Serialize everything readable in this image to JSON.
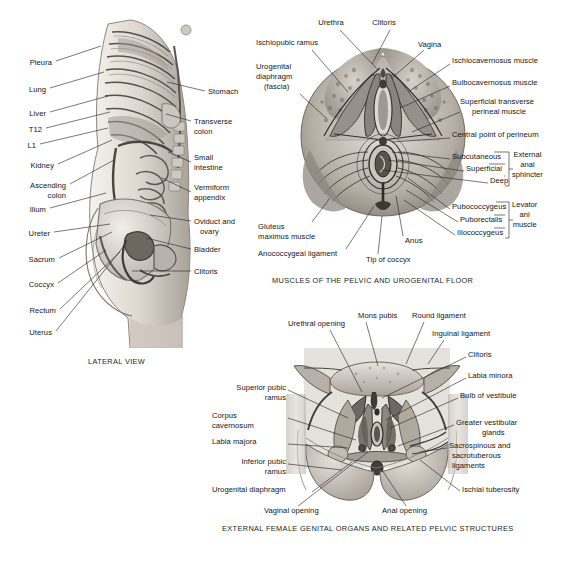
{
  "figure": {
    "background": "#ffffff",
    "ink": "#262626"
  },
  "panels": [
    {
      "id": "lateral",
      "caption": "LATERAL VIEW",
      "labels_left": [
        {
          "text": "Pleura",
          "x": 26,
          "y": 58,
          "lx": 56,
          "ly": 61,
          "tx": 101,
          "ty": 46
        },
        {
          "text": "Lung",
          "x": 26,
          "y": 85,
          "lx": 50,
          "ly": 88,
          "tx": 104,
          "ty": 72
        },
        {
          "text": "Liver",
          "x": 26,
          "y": 109,
          "lx": 50,
          "ly": 112,
          "tx": 108,
          "ty": 96
        },
        {
          "text": "T12",
          "x": 26,
          "y": 125,
          "lx": 46,
          "ly": 128,
          "tx": 110,
          "ty": 112
        },
        {
          "text": "L1",
          "x": 26,
          "y": 141,
          "lx": 40,
          "ly": 144,
          "tx": 108,
          "ty": 128
        },
        {
          "text": "Kidney",
          "x": 26,
          "y": 161,
          "lx": 58,
          "ly": 164,
          "tx": 112,
          "ty": 140
        },
        {
          "text": "Ascending",
          "x": 26,
          "y": 181,
          "lx": 70,
          "ly": 184,
          "tx": 114,
          "ty": 160
        },
        {
          "text": "colon",
          "x": 38,
          "y": 191,
          "lx": null,
          "ly": null,
          "tx": null,
          "ty": null
        },
        {
          "text": "Ilium",
          "x": 26,
          "y": 205,
          "lx": 50,
          "ly": 208,
          "tx": 106,
          "ty": 193
        },
        {
          "text": "Ureter",
          "x": 26,
          "y": 229,
          "lx": 54,
          "ly": 232,
          "tx": 108,
          "ty": 222
        },
        {
          "text": "Sacrum",
          "x": 26,
          "y": 255,
          "lx": 59,
          "ly": 258,
          "tx": 110,
          "ty": 232
        },
        {
          "text": "Coccyx",
          "x": 26,
          "y": 280,
          "lx": 58,
          "ly": 283,
          "tx": 104,
          "ty": 250
        },
        {
          "text": "Rectum",
          "x": 26,
          "y": 306,
          "lx": 60,
          "ly": 309,
          "tx": 118,
          "ty": 252
        },
        {
          "text": "Uterus",
          "x": 26,
          "y": 328,
          "lx": 56,
          "ly": 331,
          "tx": 122,
          "ty": 245
        }
      ],
      "labels_right": [
        {
          "text": "Stomach",
          "x": 208,
          "y": 88,
          "lx": 205,
          "ly": 91,
          "tx": 167,
          "ty": 82
        },
        {
          "text": "Transverse",
          "x": 194,
          "y": 118,
          "lx": 191,
          "ly": 121,
          "tx": 166,
          "ty": 113
        },
        {
          "text": "colon",
          "x": 194,
          "y": 128,
          "lx": null,
          "ly": null,
          "tx": null,
          "ty": null
        },
        {
          "text": "Small",
          "x": 194,
          "y": 154,
          "lx": 191,
          "ly": 162,
          "tx": 168,
          "ty": 152
        },
        {
          "text": "intestine",
          "x": 194,
          "y": 164,
          "lx": null,
          "ly": null,
          "tx": null,
          "ty": null
        },
        {
          "text": "Vermiform",
          "x": 194,
          "y": 184,
          "lx": 191,
          "ly": 192,
          "tx": 162,
          "ty": 178
        },
        {
          "text": "appendix",
          "x": 194,
          "y": 194,
          "lx": null,
          "ly": null,
          "tx": null,
          "ty": null
        },
        {
          "text": "Oviduct and",
          "x": 194,
          "y": 218,
          "lx": 191,
          "ly": 221,
          "tx": 150,
          "ty": 215
        },
        {
          "text": "ovary",
          "x": 200,
          "y": 228,
          "lx": null,
          "ly": null,
          "tx": null,
          "ty": null
        },
        {
          "text": "Bladder",
          "x": 194,
          "y": 246,
          "lx": 191,
          "ly": 249,
          "tx": 146,
          "ty": 238
        },
        {
          "text": "Clitoris",
          "x": 194,
          "y": 268,
          "lx": 191,
          "ly": 271,
          "tx": 132,
          "ty": 271
        }
      ]
    },
    {
      "id": "pelvic-floor",
      "caption": "MUSCLES OF THE PELVIC AND UROGENITAL FLOOR",
      "labels": [
        {
          "text": "Urethra",
          "x": 331,
          "y": 22,
          "align": "center"
        },
        {
          "text": "Clitoris",
          "x": 384,
          "y": 22,
          "align": "center"
        },
        {
          "text": "Vagina",
          "x": 418,
          "y": 44,
          "align": "left"
        },
        {
          "text": "Ischiopubic ramus",
          "x": 256,
          "y": 42,
          "align": "left"
        },
        {
          "text": "Urogenital",
          "x": 256,
          "y": 66,
          "align": "left"
        },
        {
          "text": "diaphragm",
          "x": 256,
          "y": 76,
          "align": "left"
        },
        {
          "text": "(fascia)",
          "x": 264,
          "y": 86,
          "align": "left"
        },
        {
          "text": "Ischiocavernosus muscle",
          "x": 452,
          "y": 60,
          "align": "left"
        },
        {
          "text": "Bulbocavernosus muscle",
          "x": 452,
          "y": 82,
          "align": "left"
        },
        {
          "text": "Superficial transverse",
          "x": 462,
          "y": 101,
          "align": "left"
        },
        {
          "text": "perineal muscle",
          "x": 474,
          "y": 111,
          "align": "left"
        },
        {
          "text": "Central point of perineum",
          "x": 452,
          "y": 134,
          "align": "left"
        },
        {
          "text": "Subcutaneous",
          "x": 452,
          "y": 155,
          "align": "left"
        },
        {
          "text": "Superficial",
          "x": 466,
          "y": 167,
          "align": "left"
        },
        {
          "text": "Deep",
          "x": 490,
          "y": 179,
          "align": "left"
        },
        {
          "text": "Pubococcygeus",
          "x": 452,
          "y": 205,
          "align": "left"
        },
        {
          "text": "Puborectalis",
          "x": 460,
          "y": 218,
          "align": "left"
        },
        {
          "text": "Iliococcygeus",
          "x": 457,
          "y": 231,
          "align": "left"
        },
        {
          "text": "Gluteus",
          "x": 258,
          "y": 225,
          "align": "left"
        },
        {
          "text": "maximus muscle",
          "x": 258,
          "y": 235,
          "align": "left"
        },
        {
          "text": "Anococcygeal ligament",
          "x": 258,
          "y": 252,
          "align": "left"
        },
        {
          "text": "Tip of coccyx",
          "x": 366,
          "y": 258,
          "align": "left"
        },
        {
          "text": "Anus",
          "x": 405,
          "y": 239,
          "align": "left"
        }
      ],
      "bracket_groups": [
        {
          "text_lines": [
            "External",
            "anal",
            "sphincter"
          ],
          "x": 512,
          "y": 153
        },
        {
          "text_lines": [
            "Levator",
            "ani",
            "muscle"
          ],
          "x": 512,
          "y": 203
        }
      ]
    },
    {
      "id": "external-genitalia",
      "caption": "EXTERNAL FEMALE GENITAL ORGANS AND RELATED PELVIC STRUCTURES",
      "labels": [
        {
          "text": "Urethral opening",
          "x": 288,
          "y": 322,
          "align": "left"
        },
        {
          "text": "Mons pubis",
          "x": 358,
          "y": 314,
          "align": "left"
        },
        {
          "text": "Round ligament",
          "x": 412,
          "y": 314,
          "align": "left"
        },
        {
          "text": "Inguinal ligament",
          "x": 432,
          "y": 332,
          "align": "left"
        },
        {
          "text": "Clitoris",
          "x": 468,
          "y": 353,
          "align": "left"
        },
        {
          "text": "Labia minora",
          "x": 468,
          "y": 374,
          "align": "left"
        },
        {
          "text": "Bulb of vestibule",
          "x": 460,
          "y": 394,
          "align": "left"
        },
        {
          "text": "Greater vestibular",
          "x": 456,
          "y": 421,
          "align": "left"
        },
        {
          "text": "glands",
          "x": 482,
          "y": 431,
          "align": "left"
        },
        {
          "text": "Sacrospinous and",
          "x": 449,
          "y": 444,
          "align": "left"
        },
        {
          "text": "sacrotuberous",
          "x": 452,
          "y": 454,
          "align": "left"
        },
        {
          "text": "ligaments",
          "x": 452,
          "y": 464,
          "align": "left"
        },
        {
          "text": "Ischial tuberosity",
          "x": 462,
          "y": 488,
          "align": "left"
        },
        {
          "text": "Superior pubic",
          "x": 212,
          "y": 386,
          "align": "left"
        },
        {
          "text": "ramus",
          "x": 243,
          "y": 396,
          "align": "left"
        },
        {
          "text": "Corpus",
          "x": 212,
          "y": 414,
          "align": "left"
        },
        {
          "text": "cavernosum",
          "x": 212,
          "y": 424,
          "align": "left"
        },
        {
          "text": "Labia majora",
          "x": 212,
          "y": 440,
          "align": "left"
        },
        {
          "text": "Inferior pubic",
          "x": 212,
          "y": 460,
          "align": "left"
        },
        {
          "text": "ramus",
          "x": 243,
          "y": 470,
          "align": "left"
        },
        {
          "text": "Urogenital diaphragm",
          "x": 212,
          "y": 488,
          "align": "left"
        },
        {
          "text": "Vaginal opening",
          "x": 264,
          "y": 509,
          "align": "left"
        },
        {
          "text": "Anal opening",
          "x": 382,
          "y": 509,
          "align": "left"
        }
      ]
    }
  ]
}
